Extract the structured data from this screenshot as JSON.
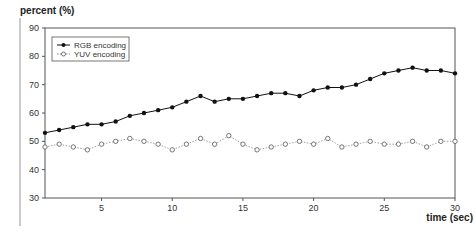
{
  "chart_data": {
    "type": "line",
    "title": "",
    "xlabel": "time (sec)",
    "ylabel": "percent (%)",
    "xlim": [
      1,
      30
    ],
    "ylim": [
      30,
      90
    ],
    "x_ticks": [
      5,
      10,
      15,
      20,
      25,
      30
    ],
    "y_ticks": [
      30,
      40,
      50,
      60,
      70,
      80,
      90
    ],
    "grid": false,
    "legend_position": "upper left",
    "x": [
      1,
      2,
      3,
      4,
      5,
      6,
      7,
      8,
      9,
      10,
      11,
      12,
      13,
      14,
      15,
      16,
      17,
      18,
      19,
      20,
      21,
      22,
      23,
      24,
      25,
      26,
      27,
      28,
      29,
      30
    ],
    "series": [
      {
        "name": "RGB encoding",
        "marker": "filled-circle",
        "line": "solid",
        "color": "#111111",
        "values": [
          53,
          54,
          55,
          56,
          56,
          57,
          59,
          60,
          61,
          62,
          64,
          66,
          64,
          65,
          65,
          66,
          67,
          67,
          66,
          68,
          69,
          69,
          70,
          72,
          74,
          75,
          76,
          75,
          75,
          74
        ]
      },
      {
        "name": "YUV encoding",
        "marker": "open-circle",
        "line": "dotted",
        "color": "#888888",
        "values": [
          48,
          49,
          48,
          47,
          49,
          50,
          51,
          50,
          49,
          47,
          49,
          51,
          49,
          52,
          49,
          47,
          48,
          49,
          50,
          49,
          51,
          48,
          49,
          50,
          49,
          49,
          50,
          48,
          50,
          50
        ]
      }
    ]
  }
}
